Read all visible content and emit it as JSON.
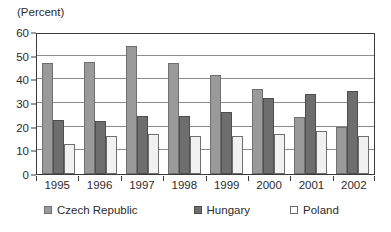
{
  "chart_data": {
    "type": "bar",
    "title": "",
    "subtitle": "",
    "unit_label": "(Percent)",
    "xlabel": "",
    "ylabel": "",
    "ylim": [
      0,
      60
    ],
    "yticks": [
      0,
      10,
      20,
      30,
      40,
      50,
      60
    ],
    "ytick_labels": [
      "0",
      "10",
      "20",
      "30",
      "40",
      "50",
      "60"
    ],
    "grid": true,
    "grid_axis": "y",
    "legend_position": "bottom",
    "categories": [
      "1995",
      "1996",
      "1997",
      "1998",
      "1999",
      "2000",
      "2001",
      "2002"
    ],
    "series": [
      {
        "name": "Czech Republic",
        "color": "#9a9a9a",
        "values": [
          47,
          47.5,
          54,
          47,
          42,
          36,
          24,
          20
        ]
      },
      {
        "name": "Hungary",
        "color": "#6e6e6e",
        "values": [
          23,
          22.5,
          24.5,
          24.5,
          26,
          32,
          34,
          35
        ]
      },
      {
        "name": "Poland",
        "color": "#f1f1f1",
        "values": [
          12.5,
          16,
          17,
          16,
          16,
          17,
          18,
          16
        ]
      }
    ]
  },
  "axis": {
    "unit_caption": "(Percent)"
  }
}
